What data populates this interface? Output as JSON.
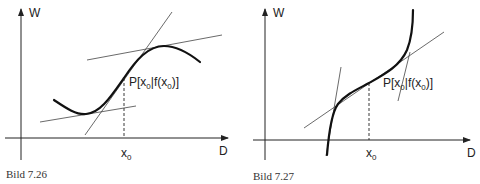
{
  "figures": [
    {
      "caption": "Bild 7.26",
      "y_axis_label": "W",
      "x_axis_label": "D",
      "x0_label": "x",
      "x0_sub": "0",
      "point_label_parts": {
        "p": "P[x",
        "sub1": "0",
        "mid": "|f(x",
        "sub2": "0",
        "end": ")]"
      }
    },
    {
      "caption": "Bild 7.27",
      "y_axis_label": "W",
      "x_axis_label": "D",
      "x0_label": "x",
      "x0_sub": "0",
      "point_label_parts": {
        "p": "P[x",
        "sub1": "0",
        "mid": "|f(x",
        "sub2": "0",
        "end": ")]"
      }
    }
  ],
  "colors": {
    "line": "#222222",
    "background": "#ffffff"
  }
}
